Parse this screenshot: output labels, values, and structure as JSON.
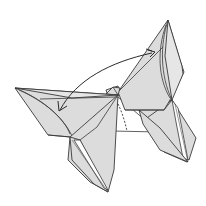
{
  "diagram": {
    "colors": {
      "paper": "#dcdcdc",
      "paper_light": "#e6e6e6",
      "outline": "#3a3a3a",
      "background": "#ffffff"
    },
    "symbols": [
      {
        "name": "double-headed-curved-arrow",
        "from": "upper-right wing",
        "to": "left wing"
      },
      {
        "name": "valley-fold-dashed-line",
        "location": "center, below wings"
      }
    ]
  }
}
